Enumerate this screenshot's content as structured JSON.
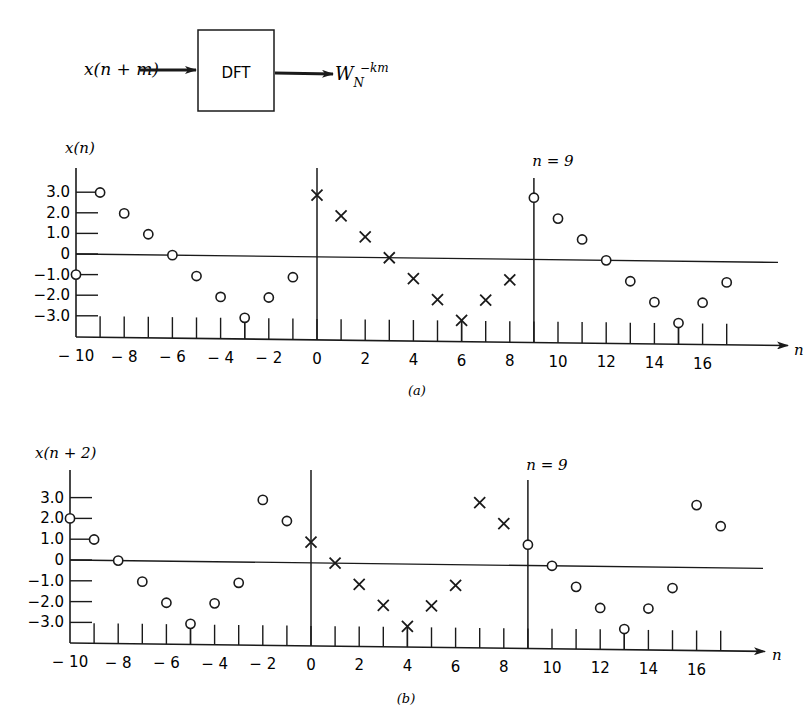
{
  "block_diagram": {
    "input_label": "x(n + m)",
    "block_label": "DFT",
    "output_base": "W",
    "output_sub": "N",
    "output_sup": "−km"
  },
  "colors": {
    "ink": "#1a1a1a",
    "background": "#ffffff"
  },
  "chart_data": [
    {
      "type": "scatter",
      "id": "a",
      "caption": "(a)",
      "title": "",
      "ylabel": "x(n)",
      "xlabel": "n",
      "marker_annotation": "n = 9",
      "ylim": [
        -3.0,
        3.0
      ],
      "yticks": [
        "3.0",
        "2.0",
        "1.0",
        "0",
        "−1.0",
        "−2.0",
        "−3.0"
      ],
      "ytick_values": [
        3,
        2,
        1,
        0,
        -1,
        -2,
        -3
      ],
      "xticks": [
        "−10",
        "−8",
        "−6",
        "−4",
        "−2",
        "0",
        "2",
        "4",
        "6",
        "8",
        "10",
        "12",
        "14",
        "16"
      ],
      "xtick_values": [
        -10,
        -8,
        -6,
        -4,
        -2,
        0,
        2,
        4,
        6,
        8,
        10,
        12,
        14,
        16
      ],
      "xlim": [
        -10,
        17
      ],
      "grid": false,
      "series": [
        {
          "name": "periodic extension (left)",
          "marker": "circle",
          "x": [
            -10,
            -9,
            -8,
            -7,
            -6,
            -5,
            -4,
            -3,
            -2,
            -1
          ],
          "values": [
            -1,
            3,
            2,
            1,
            0,
            -1,
            -2,
            -3,
            -2,
            -1
          ]
        },
        {
          "name": "data window n=0..8",
          "marker": "x",
          "x": [
            0,
            1,
            2,
            3,
            4,
            5,
            6,
            7,
            8
          ],
          "values": [
            3,
            2,
            1,
            0,
            -1,
            -2,
            -3,
            -2,
            -1
          ]
        },
        {
          "name": "periodic extension (right)",
          "marker": "circle",
          "x": [
            9,
            10,
            11,
            12,
            13,
            14,
            15,
            16,
            17
          ],
          "values": [
            3,
            2,
            1,
            0,
            -1,
            -2,
            -3,
            -2,
            -1
          ]
        }
      ],
      "vertical_lines": [
        0,
        9
      ]
    },
    {
      "type": "scatter",
      "id": "b",
      "caption": "(b)",
      "title": "",
      "ylabel": "x(n + 2)",
      "xlabel": "n",
      "marker_annotation": "n = 9",
      "ylim": [
        -3.0,
        3.0
      ],
      "yticks": [
        "3.0",
        "2.0",
        "1.0",
        "0",
        "−1.0",
        "−2.0",
        "−3.0"
      ],
      "ytick_values": [
        3,
        2,
        1,
        0,
        -1,
        -2,
        -3
      ],
      "xticks": [
        "−10",
        "−8",
        "−6",
        "−4",
        "−2",
        "0",
        "2",
        "4",
        "6",
        "8",
        "10",
        "12",
        "14",
        "16"
      ],
      "xtick_values": [
        -10,
        -8,
        -6,
        -4,
        -2,
        0,
        2,
        4,
        6,
        8,
        10,
        12,
        14,
        16
      ],
      "xlim": [
        -10,
        17
      ],
      "grid": false,
      "series": [
        {
          "name": "periodic extension (left)",
          "marker": "circle",
          "x": [
            -10,
            -9,
            -8,
            -7,
            -6,
            -5,
            -4,
            -3,
            -2,
            -1
          ],
          "values": [
            2,
            1,
            0,
            -1,
            -2,
            -3,
            -2,
            -1,
            3,
            2
          ]
        },
        {
          "name": "data window n=0..8",
          "marker": "x",
          "x": [
            0,
            1,
            2,
            3,
            4,
            5,
            6,
            7,
            8
          ],
          "values": [
            1,
            0,
            -1,
            -2,
            -3,
            -2,
            -1,
            3,
            2
          ]
        },
        {
          "name": "periodic extension (right)",
          "marker": "circle",
          "x": [
            9,
            10,
            11,
            12,
            13,
            14,
            15,
            16,
            17
          ],
          "values": [
            1,
            0,
            -1,
            -2,
            -3,
            -2,
            -1,
            3,
            2
          ]
        }
      ],
      "vertical_lines": [
        0,
        9
      ]
    }
  ]
}
